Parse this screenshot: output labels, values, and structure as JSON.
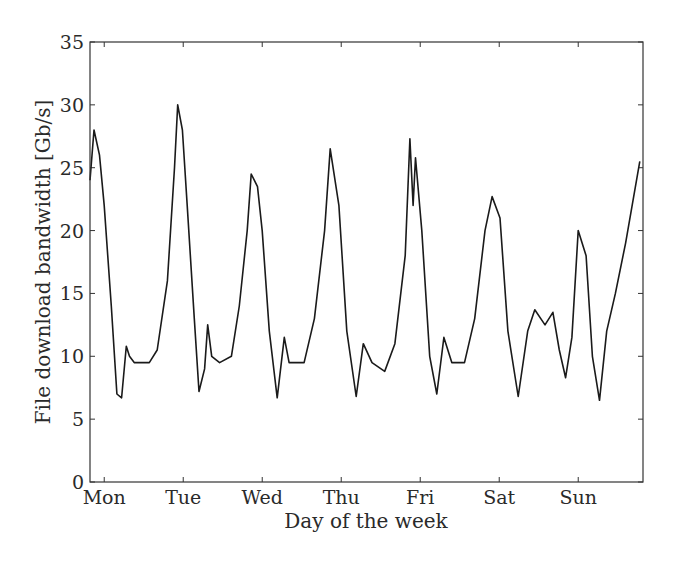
{
  "chart_data": {
    "type": "line",
    "title": "",
    "xlabel": "Day of the week",
    "ylabel": "File download bandwidth [Gb/s]",
    "ylim": [
      0,
      35
    ],
    "yticks": [
      0,
      5,
      10,
      15,
      20,
      25,
      30,
      35
    ],
    "xticks": [
      "Mon",
      "Tue",
      "Wed",
      "Thu",
      "Fri",
      "Sat",
      "Sun"
    ],
    "xlim_days": [
      -0.18,
      6.82
    ],
    "grid": false,
    "legend": null,
    "line_color": "#1a1a1a",
    "series": [
      {
        "name": "File download bandwidth",
        "x_days": [
          -0.18,
          -0.13,
          -0.06,
          0.0,
          0.09,
          0.16,
          0.22,
          0.28,
          0.32,
          0.38,
          0.57,
          0.67,
          0.8,
          0.89,
          0.93,
          0.99,
          1.05,
          1.14,
          1.2,
          1.27,
          1.31,
          1.36,
          1.46,
          1.61,
          1.71,
          1.81,
          1.86,
          1.94,
          2.0,
          2.09,
          2.19,
          2.28,
          2.34,
          2.53,
          2.66,
          2.79,
          2.86,
          2.97,
          3.07,
          3.19,
          3.28,
          3.39,
          3.55,
          3.68,
          3.81,
          3.87,
          3.91,
          3.94,
          4.02,
          4.12,
          4.21,
          4.3,
          4.4,
          4.56,
          4.69,
          4.82,
          4.91,
          5.01,
          5.11,
          5.24,
          5.36,
          5.45,
          5.58,
          5.68,
          5.76,
          5.84,
          5.92,
          6.0,
          6.1,
          6.18,
          6.27,
          6.36,
          6.47,
          6.6,
          6.78
        ],
        "values": [
          24,
          28,
          26,
          22,
          14,
          7,
          6.7,
          10.8,
          10,
          9.5,
          9.5,
          10.5,
          16,
          25,
          30,
          28,
          22,
          13,
          7.2,
          9,
          12.5,
          10,
          9.5,
          10,
          14,
          20,
          24.5,
          23.5,
          20,
          12,
          6.7,
          11.5,
          9.5,
          9.5,
          13,
          20,
          26.5,
          22,
          12,
          6.8,
          11,
          9.5,
          8.8,
          11,
          18,
          27.3,
          22,
          25.8,
          20,
          10,
          7,
          11.5,
          9.5,
          9.5,
          13,
          20,
          22.7,
          21,
          12,
          6.8,
          12,
          13.7,
          12.5,
          13.5,
          10.5,
          8.3,
          11.5,
          20,
          18,
          10,
          6.5,
          12,
          15,
          19,
          25.5
        ]
      }
    ]
  }
}
